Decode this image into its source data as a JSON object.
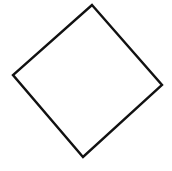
{
  "canvas": {
    "width": 172,
    "height": 171,
    "background": "#ffffff"
  },
  "shape": {
    "type": "quadrilateral",
    "description": "hand-drawn rotated square (diamond) outline",
    "stroke": "#111111",
    "stroke_width": 2.4,
    "fill": "none",
    "vertices": [
      {
        "name": "top",
        "x": 92,
        "y": 5
      },
      {
        "name": "right",
        "x": 162,
        "y": 85
      },
      {
        "name": "bottom",
        "x": 83,
        "y": 157
      },
      {
        "name": "left",
        "x": 13,
        "y": 75
      }
    ]
  }
}
